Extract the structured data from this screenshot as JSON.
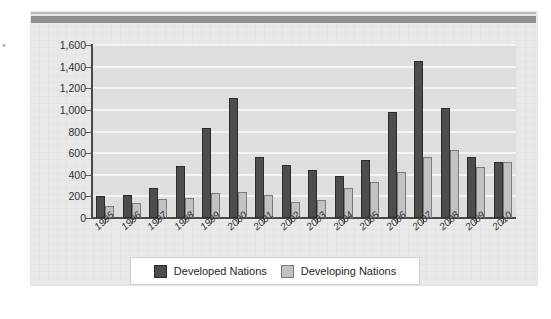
{
  "legend": {
    "items": [
      {
        "label": "Developed Nations",
        "key": "developed",
        "color": "#4d4d4d",
        "swatch_icon": "legend-swatch-dark"
      },
      {
        "label": "Developing Nations",
        "key": "developing",
        "color": "#c2c2c2",
        "swatch_icon": "legend-swatch-light"
      }
    ]
  },
  "axes": {
    "y_ticks": [
      "1,600",
      "1,400",
      "1,200",
      "1,000",
      "800",
      "600",
      "400",
      "200",
      "0"
    ],
    "y_tick_values": [
      1600,
      1400,
      1200,
      1000,
      800,
      600,
      400,
      200,
      0
    ]
  },
  "marks": {
    "left_edge_glyph": "•"
  },
  "chart_data": {
    "type": "bar",
    "title": "",
    "subtitle": "",
    "xlabel": "",
    "ylabel": "",
    "ylim": [
      0,
      1600
    ],
    "grid": true,
    "legend_position": "bottom",
    "orientation": "vertical",
    "grouping": "grouped",
    "categories": [
      "1995",
      "1996",
      "1997",
      "1998",
      "1999",
      "2000",
      "2001",
      "2002",
      "2003",
      "2004",
      "2005",
      "2006",
      "2007",
      "2008",
      "2009",
      "2010"
    ],
    "series": [
      {
        "name": "Developed Nations",
        "color": "#4d4d4d",
        "values": [
          200,
          215,
          275,
          485,
          830,
          1110,
          565,
          490,
          440,
          390,
          540,
          980,
          1450,
          1020,
          560,
          520
        ]
      },
      {
        "name": "Developing Nations",
        "color": "#c2c2c2",
        "values": [
          110,
          140,
          180,
          185,
          230,
          245,
          210,
          150,
          165,
          275,
          335,
          425,
          565,
          630,
          470,
          520
        ]
      }
    ]
  }
}
